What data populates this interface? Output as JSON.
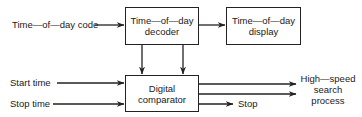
{
  "diagram": {
    "type": "block-diagram",
    "blocks": {
      "decoder": "Time—of—day decoder",
      "display": "Time—of—day display",
      "comparator": "Digital comparator"
    },
    "decoder_lines": [
      "Time—of—day",
      "decoder"
    ],
    "display_lines": [
      "Time—of—day",
      "display"
    ],
    "comparator_lines": [
      "Digital",
      "comparator"
    ],
    "inputs": {
      "time_code": "Time—of—day code",
      "start_time": "Start time",
      "stop_time": "Stop time"
    },
    "outputs": {
      "stop": "Stop",
      "high_speed_lines": [
        "High—speed",
        "search",
        "process"
      ]
    },
    "edges": [
      {
        "from": "Time-of-day code",
        "to": "decoder"
      },
      {
        "from": "decoder",
        "to": "display"
      },
      {
        "from": "decoder",
        "to": "comparator",
        "count": 2
      },
      {
        "from": "Start time",
        "to": "comparator"
      },
      {
        "from": "Stop time",
        "to": "comparator"
      },
      {
        "from": "comparator",
        "to": "High-speed search process",
        "count": 2
      },
      {
        "from": "comparator",
        "to": "Stop"
      }
    ],
    "colors": {
      "line": "#222222",
      "background": "#ffffff"
    }
  }
}
